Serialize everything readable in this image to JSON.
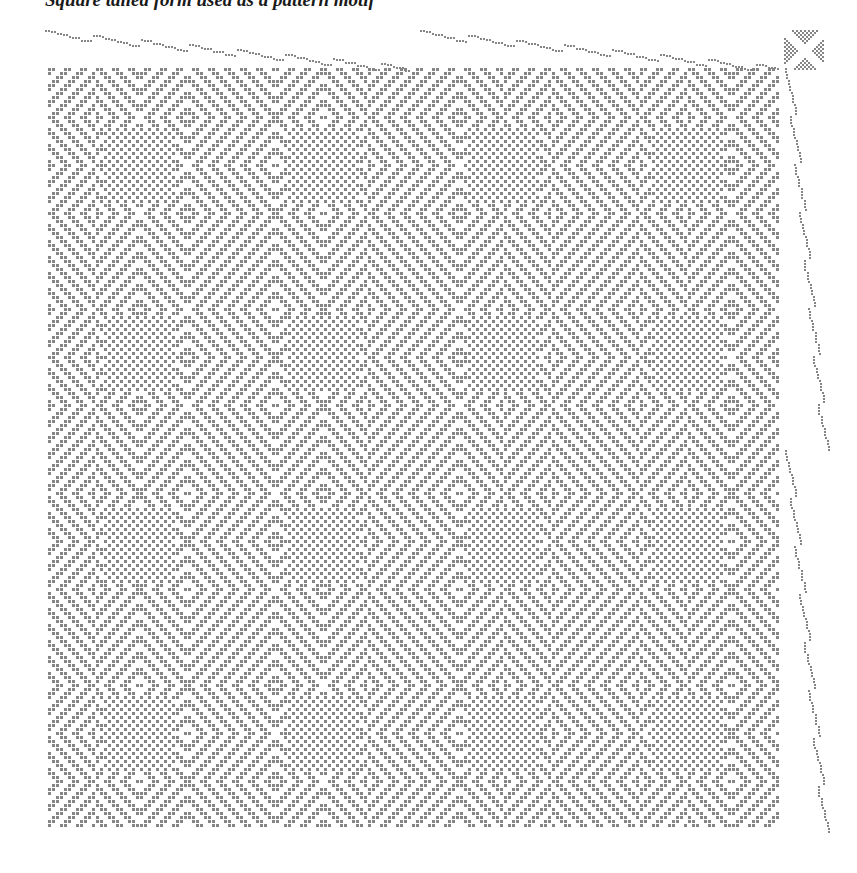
{
  "caption": {
    "text": "Square tailed form used as a pattern motif"
  },
  "draft": {
    "type": "weaving-drawdown",
    "cell_size_px": 4,
    "colors": {
      "background": "#ffffff",
      "cell": "#858585",
      "caption": "#1a1a1a"
    },
    "pattern_area": {
      "x": 48,
      "y": 68,
      "width": 732,
      "height": 762
    },
    "threading": {
      "runs": [
        {
          "x_start": 45,
          "x_end": 410,
          "y_start": 30,
          "y_end": 66
        },
        {
          "x_start": 420,
          "x_end": 780,
          "y_start": 30,
          "y_end": 66
        }
      ]
    },
    "treadling": {
      "runs": [
        {
          "y_start": 68,
          "y_end": 450,
          "x_start": 785,
          "x_end": 822
        },
        {
          "y_start": 450,
          "y_end": 832,
          "x_start": 785,
          "x_end": 822
        }
      ]
    },
    "tieup": {
      "x": 784,
      "y": 30,
      "width": 40,
      "height": 40
    },
    "repeat": {
      "horizontal": 2,
      "vertical": 2
    }
  }
}
